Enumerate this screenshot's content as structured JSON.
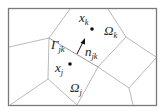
{
  "diagram": {
    "type": "voronoi-cell-partition",
    "frame": {
      "x": 8,
      "y": 8,
      "width": 149,
      "height": 98,
      "color": "#7a7a7a"
    },
    "edge_color": "#a8a8a8",
    "points": {
      "xk": {
        "base": "x",
        "sub": "k",
        "cx": 92,
        "cy": 29
      },
      "xj": {
        "base": "x",
        "sub": "j",
        "cx": 70,
        "cy": 64
      }
    },
    "regions": {
      "omega_k": {
        "base": "Ω",
        "sub": "k"
      },
      "omega_j": {
        "base": "Ω",
        "sub": "j"
      }
    },
    "interface": {
      "base": "Γ",
      "sub": "jk"
    },
    "normal": {
      "base": "n",
      "sub": "jk"
    },
    "vertices": {
      "A": [
        49,
        38
      ],
      "B": [
        98,
        67
      ],
      "C": [
        126,
        37
      ],
      "E": [
        129,
        88
      ],
      "F": [
        48,
        79
      ]
    }
  }
}
